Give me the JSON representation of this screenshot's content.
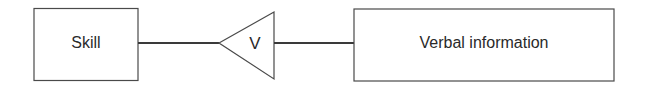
{
  "diagram": {
    "type": "relationship-diagram",
    "nodes": [
      {
        "id": "skill",
        "label": "Skill",
        "shape": "rectangle"
      },
      {
        "id": "relation",
        "label": "V",
        "shape": "triangle-left-pointing"
      },
      {
        "id": "verbal",
        "label": "Verbal information",
        "shape": "rectangle"
      }
    ],
    "edges": [
      {
        "from": "skill",
        "to": "relation"
      },
      {
        "from": "relation",
        "to": "verbal"
      }
    ],
    "colors": {
      "stroke": "#4a4a4a",
      "text": "#2a2a2a",
      "background": "#ffffff"
    }
  }
}
